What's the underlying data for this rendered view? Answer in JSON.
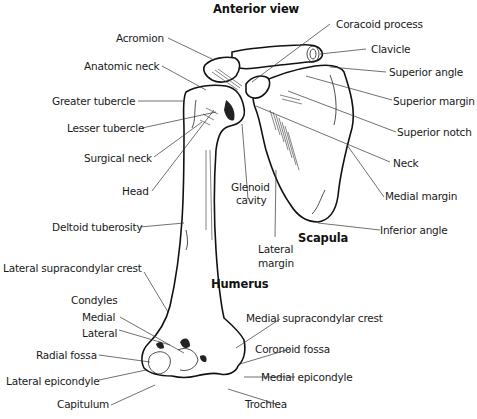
{
  "diagram": {
    "title": "Anterior view",
    "sections": {
      "scapula": "Scapula",
      "humerus": "Humerus"
    },
    "labels_left": [
      {
        "id": "acromion",
        "text": "Acromion"
      },
      {
        "id": "anatomic-neck",
        "text": "Anatomic neck"
      },
      {
        "id": "greater-tubercle",
        "text": "Greater tubercle"
      },
      {
        "id": "lesser-tubercle",
        "text": "Lesser tubercle"
      },
      {
        "id": "surgical-neck",
        "text": "Surgical neck"
      },
      {
        "id": "head",
        "text": "Head"
      },
      {
        "id": "deltoid-tuberosity",
        "text": "Deltoid tuberosity"
      },
      {
        "id": "lateral-supracondylar-crest",
        "text": "Lateral supracondylar crest"
      },
      {
        "id": "condyles",
        "text": "Condyles"
      },
      {
        "id": "condyle-medial",
        "text": "Medial"
      },
      {
        "id": "condyle-lateral",
        "text": "Lateral"
      },
      {
        "id": "radial-fossa",
        "text": "Radial fossa"
      },
      {
        "id": "lateral-epicondyle",
        "text": "Lateral epicondyle"
      },
      {
        "id": "capitulum",
        "text": "Capitulum"
      }
    ],
    "labels_right": [
      {
        "id": "coracoid-process",
        "text": "Coracoid process"
      },
      {
        "id": "clavicle",
        "text": "Clavicle"
      },
      {
        "id": "superior-angle",
        "text": "Superior angle"
      },
      {
        "id": "superior-margin",
        "text": "Superior margin"
      },
      {
        "id": "superior-notch",
        "text": "Superior notch"
      },
      {
        "id": "neck",
        "text": "Neck"
      },
      {
        "id": "medial-margin",
        "text": "Medial margin"
      },
      {
        "id": "inferior-angle",
        "text": "Inferior angle"
      },
      {
        "id": "medial-supracondylar-crest",
        "text": "Medial supracondylar crest"
      },
      {
        "id": "coronoid-fossa",
        "text": "Coronoid fossa"
      },
      {
        "id": "medial-epicondyle",
        "text": "Medial epicondyle"
      },
      {
        "id": "trochlea",
        "text": "Trochlea"
      }
    ],
    "labels_center": [
      {
        "id": "glenoid-cavity-1",
        "text": "Glenoid"
      },
      {
        "id": "glenoid-cavity-2",
        "text": "cavity"
      },
      {
        "id": "lateral-margin-1",
        "text": "Lateral"
      },
      {
        "id": "lateral-margin-2",
        "text": "margin"
      }
    ]
  }
}
